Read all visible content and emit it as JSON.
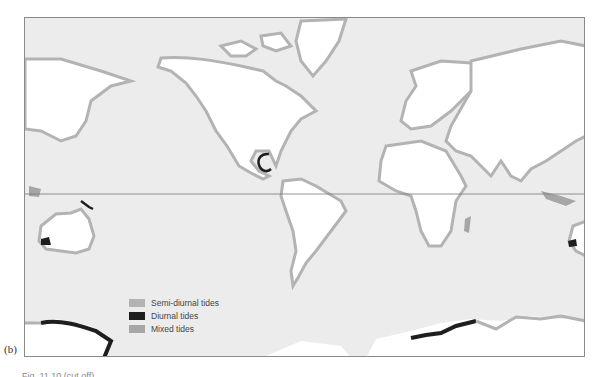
{
  "figure": {
    "panel_label": "(b)",
    "caption_partial": "Fig. 11.10 (cut off)",
    "projection": "world map, Mercator-like, Pacific-centered edges"
  },
  "colors": {
    "ocean": "#ececec",
    "land": "#ffffff",
    "semi_diurnal": "#b3b3b3",
    "diurnal": "#1e1e1e",
    "mixed": "#a6a6a6",
    "equator_line": "#7a7a7a",
    "frame": "#8a8a8a"
  },
  "legend": {
    "items": [
      {
        "label": "Semi-diurnal tides",
        "color": "#b3b3b3"
      },
      {
        "label": "Diurnal tides",
        "color": "#1e1e1e"
      },
      {
        "label": "Mixed tides",
        "color": "#a6a6a6"
      }
    ]
  },
  "map": {
    "equator_y": 193,
    "diurnal_regions": [
      "Gulf of Mexico",
      "Southwest Australia",
      "New Guinea coast",
      "Antarctica (west)",
      "Antarctica (Indian Ocean sector)",
      "East Australia edge"
    ],
    "continents": [
      "North America",
      "South America",
      "Europe",
      "Africa",
      "Asia",
      "Australia",
      "Antarctica",
      "Greenland"
    ]
  }
}
